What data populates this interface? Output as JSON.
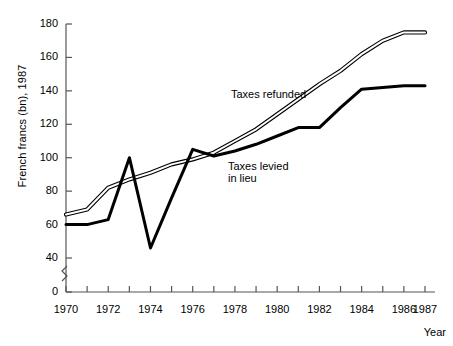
{
  "chart_data": {
    "type": "line",
    "title": "",
    "xlabel": "Year",
    "ylabel": "French francs (bn), 1987",
    "xlim": [
      1970,
      1987
    ],
    "ylim": [
      0,
      180
    ],
    "y_axis_break": true,
    "y_break_range": [
      0,
      40
    ],
    "grid": false,
    "legend_position": "inline-annotations",
    "ytick_labels": [
      "0",
      "40",
      "60",
      "80",
      "100",
      "120",
      "140",
      "160",
      "180"
    ],
    "ytick_values": [
      0,
      40,
      60,
      80,
      100,
      120,
      140,
      160,
      180
    ],
    "xtick_values": [
      1970,
      1971,
      1972,
      1973,
      1974,
      1975,
      1976,
      1977,
      1978,
      1979,
      1980,
      1981,
      1982,
      1983,
      1984,
      1985,
      1986,
      1987
    ],
    "xtick_labels": [
      "1970",
      "",
      "1972",
      "",
      "1974",
      "",
      "1976",
      "",
      "1978",
      "",
      "1980",
      "",
      "1982",
      "",
      "1984",
      "",
      "1986",
      "1987"
    ],
    "x": [
      1970,
      1971,
      1972,
      1973,
      1974,
      1975,
      1976,
      1977,
      1978,
      1979,
      1980,
      1981,
      1982,
      1983,
      1984,
      1985,
      1986,
      1987
    ],
    "series": [
      {
        "name": "Taxes refunded",
        "style": "double-line",
        "color": "#000000",
        "values": [
          66,
          69,
          82,
          87,
          91,
          96,
          99,
          103,
          110,
          117,
          126,
          135,
          144,
          152,
          162,
          170,
          175,
          175
        ]
      },
      {
        "name": "Taxes levied in lieu",
        "style": "thick-line",
        "color": "#000000",
        "values": [
          60,
          60,
          63,
          100,
          46,
          76,
          105,
          101,
          104,
          108,
          113,
          118,
          118,
          130,
          141,
          142,
          143,
          143
        ]
      }
    ],
    "annotations": [
      {
        "text": "Taxes refunded",
        "x_px": 231,
        "y_px": 88
      },
      {
        "text": "Taxes levied\nin lieu",
        "x_px": 228,
        "y_px": 160
      }
    ]
  }
}
